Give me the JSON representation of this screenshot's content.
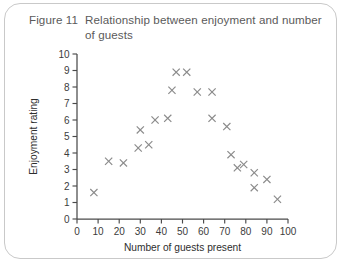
{
  "figure": {
    "number": "Figure 11",
    "title": "Relationship between enjoyment and number of guests"
  },
  "chart_data": {
    "type": "scatter",
    "title": "Relationship between enjoyment and number of guests",
    "xlabel": "Number of guests present",
    "ylabel": "Enjoyment rating",
    "xlim": [
      0,
      100
    ],
    "ylim": [
      0,
      10
    ],
    "xticks": [
      0,
      10,
      20,
      30,
      40,
      50,
      60,
      70,
      80,
      90,
      100
    ],
    "yticks": [
      0,
      1,
      2,
      3,
      4,
      5,
      6,
      7,
      8,
      9,
      10
    ],
    "grid": false,
    "legend": false,
    "marker": "x",
    "marker_color": "#8a8a8a",
    "points": [
      {
        "x": 8,
        "y": 1.6
      },
      {
        "x": 15,
        "y": 3.5
      },
      {
        "x": 22,
        "y": 3.4
      },
      {
        "x": 29,
        "y": 4.3
      },
      {
        "x": 34,
        "y": 4.5
      },
      {
        "x": 30,
        "y": 5.4
      },
      {
        "x": 37,
        "y": 6.0
      },
      {
        "x": 43,
        "y": 6.1
      },
      {
        "x": 45,
        "y": 7.8
      },
      {
        "x": 47,
        "y": 8.9
      },
      {
        "x": 52,
        "y": 8.9
      },
      {
        "x": 57,
        "y": 7.7
      },
      {
        "x": 64,
        "y": 7.7
      },
      {
        "x": 64,
        "y": 6.1
      },
      {
        "x": 71,
        "y": 5.6
      },
      {
        "x": 73,
        "y": 3.9
      },
      {
        "x": 76,
        "y": 3.1
      },
      {
        "x": 79,
        "y": 3.3
      },
      {
        "x": 84,
        "y": 2.8
      },
      {
        "x": 84,
        "y": 1.9
      },
      {
        "x": 90,
        "y": 2.4
      },
      {
        "x": 95,
        "y": 1.2
      }
    ]
  }
}
